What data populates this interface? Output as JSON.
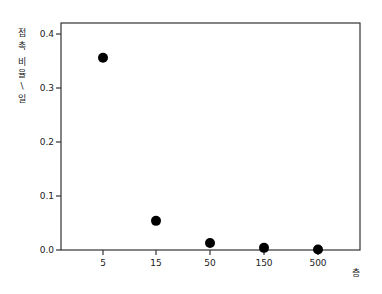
{
  "chart_data": {
    "type": "scatter",
    "title": "",
    "xlabel": "층",
    "ylabel": "접촉 비율/일",
    "categories": [
      "5",
      "15",
      "50",
      "150",
      "500"
    ],
    "values": [
      0.356,
      0.054,
      0.013,
      0.004,
      0.001
    ],
    "ylim": [
      0.0,
      0.42
    ],
    "yticks": [
      "0.0",
      "0.1",
      "0.2",
      "0.3",
      "0.4"
    ],
    "ytick_values": [
      0.0,
      0.1,
      0.2,
      0.3,
      0.4
    ],
    "grid": false,
    "legend": null,
    "marker_color": "#000000"
  },
  "plot": {
    "ylabel_chars": [
      "접",
      "촉",
      "비",
      "율",
      "\\",
      "일"
    ],
    "xlabel": "층"
  }
}
